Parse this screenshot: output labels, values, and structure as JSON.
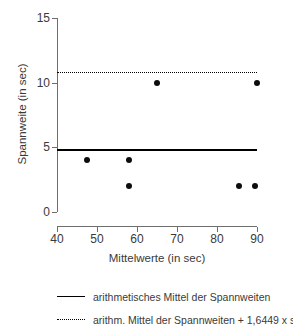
{
  "chart_data": {
    "type": "scatter",
    "title": "",
    "xlabel": "Mittelwerte (in sec)",
    "ylabel": "Spannweite (in sec)",
    "xlim": [
      40,
      90
    ],
    "ylim": [
      0,
      15
    ],
    "xticks": [
      40,
      50,
      60,
      70,
      80,
      90
    ],
    "xtick_labels": [
      "40",
      "50",
      "60",
      "70",
      "80",
      "90"
    ],
    "yticks": [
      0,
      5,
      10,
      15
    ],
    "ytick_labels": [
      "0",
      "5",
      "10",
      "15"
    ],
    "grid": false,
    "legend_position": "below",
    "points": [
      {
        "x": 47.5,
        "y": 4
      },
      {
        "x": 58,
        "y": 4
      },
      {
        "x": 58,
        "y": 2
      },
      {
        "x": 65,
        "y": 10
      },
      {
        "x": 85.5,
        "y": 2
      },
      {
        "x": 89.5,
        "y": 2
      },
      {
        "x": 90,
        "y": 10
      }
    ],
    "reference_lines": [
      {
        "name": "arithmetisches Mittel der Spannweiten",
        "style": "solid",
        "value": 4.85
      },
      {
        "name": "arithm. Mittel der Spannweiten + 1,6449 x s",
        "style": "dotted",
        "value": 10.8
      }
    ],
    "series": [
      {
        "name": "Spannweite",
        "x": [
          47.5,
          58,
          58,
          65,
          85.5,
          89.5,
          90
        ],
        "values": [
          4,
          4,
          2,
          10,
          2,
          2,
          10
        ]
      }
    ]
  },
  "legend": {
    "items": [
      {
        "label": "arithmetisches Mittel der Spannweiten",
        "style": "solid"
      },
      {
        "label": "arithm. Mittel der Spannweiten + 1,6449 x s",
        "style": "dotted"
      }
    ]
  },
  "colors": {
    "axis": "#6e6e6e",
    "text": "#3a3a3a",
    "marker": "#0d0d0d",
    "line": "#000000",
    "background": "#ffffff"
  }
}
